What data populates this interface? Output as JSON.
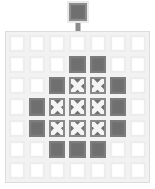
{
  "scene": {
    "title": "Grid drop action",
    "background_color": "#ffffff",
    "board_background_color": "#f2f2f2",
    "board_border_color": "#dcdcdc"
  },
  "legend": {
    "empty_label": "empty cell",
    "filled_label": "filled cell",
    "cross_label": "crossed cell",
    "empty_color": "#ffffff",
    "filled_color": "#6f6f6f",
    "cross_color": "#6f6f6f",
    "cross_mark_color": "#f4f4f4"
  },
  "drag": {
    "tile_state": "filled",
    "tile_label": "dragged tile",
    "arrow_label": "drop-down arrow",
    "arrow_color": "#8c8c8c",
    "target_column": 4
  },
  "board": {
    "columns": 7,
    "rows": 7,
    "cells": [
      [
        "empty",
        "empty",
        "empty",
        "empty",
        "empty",
        "empty",
        "empty"
      ],
      [
        "empty",
        "empty",
        "empty",
        "filled",
        "filled",
        "empty",
        "empty"
      ],
      [
        "empty",
        "empty",
        "filled",
        "cross",
        "cross",
        "filled",
        "empty"
      ],
      [
        "empty",
        "filled",
        "cross",
        "cross",
        "cross",
        "filled",
        "empty"
      ],
      [
        "empty",
        "filled",
        "cross",
        "cross",
        "cross",
        "filled",
        "empty"
      ],
      [
        "empty",
        "empty",
        "filled",
        "filled",
        "filled",
        "empty",
        "empty"
      ],
      [
        "empty",
        "empty",
        "empty",
        "empty",
        "empty",
        "empty",
        "empty"
      ]
    ]
  }
}
